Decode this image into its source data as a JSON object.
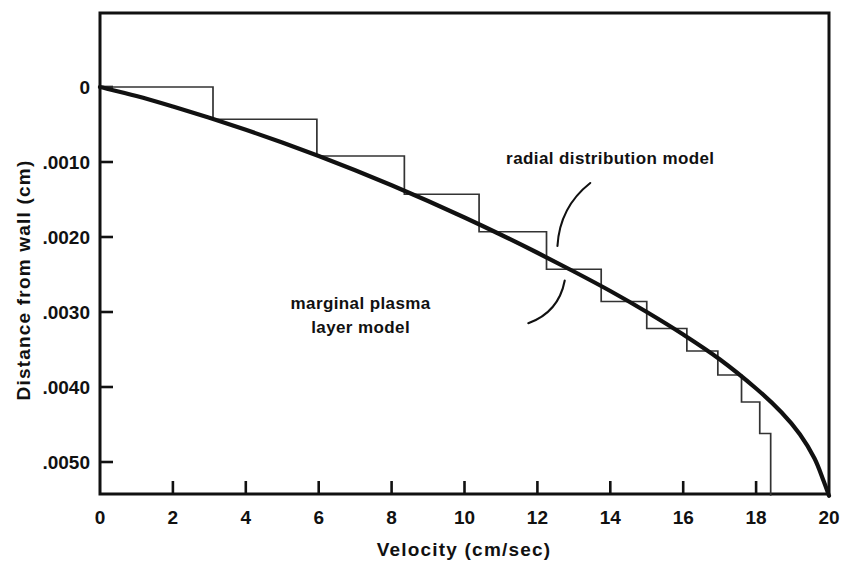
{
  "chart_data": {
    "type": "line",
    "title": "",
    "xlabel": "Velocity (cm/sec)",
    "ylabel": "Distance from wall  (cm)",
    "xlim": [
      0,
      20
    ],
    "ylim": [
      0,
      0.0055
    ],
    "y_axis_inverted": true,
    "grid": false,
    "legend_position": "inline-annotations",
    "xticks": [
      0,
      2,
      4,
      6,
      8,
      10,
      12,
      14,
      16,
      18,
      20
    ],
    "xtick_labels": [
      "0",
      "2",
      "4",
      "6",
      "8",
      "10",
      "12",
      "14",
      "16",
      "18",
      "20"
    ],
    "yticks": [
      0,
      0.001,
      0.002,
      0.003,
      0.004,
      0.005
    ],
    "ytick_labels": [
      "0",
      ".0010",
      ".0020",
      ".0030",
      ".0040",
      ".0050"
    ],
    "series": [
      {
        "name": "marginal plasma layer model",
        "style": "thick-smooth-curve",
        "color": "#111111",
        "points": [
          [
            0.0,
            0.0
          ],
          [
            1.0,
            0.00012
          ],
          [
            2.0,
            0.00026
          ],
          [
            3.0,
            0.00041
          ],
          [
            4.0,
            0.00057
          ],
          [
            5.0,
            0.00074
          ],
          [
            6.0,
            0.00092
          ],
          [
            7.0,
            0.00111
          ],
          [
            8.0,
            0.00131
          ],
          [
            9.0,
            0.00152
          ],
          [
            10.0,
            0.00174
          ],
          [
            11.0,
            0.00197
          ],
          [
            12.0,
            0.00221
          ],
          [
            13.0,
            0.00246
          ],
          [
            14.0,
            0.00272
          ],
          [
            15.0,
            0.003
          ],
          [
            16.0,
            0.0033
          ],
          [
            17.0,
            0.00363
          ],
          [
            18.0,
            0.00402
          ],
          [
            18.7,
            0.00434
          ],
          [
            19.2,
            0.00463
          ],
          [
            19.6,
            0.00495
          ],
          [
            19.85,
            0.00525
          ],
          [
            20.0,
            0.00545
          ]
        ]
      },
      {
        "name": "radial distribution model",
        "style": "staircase",
        "color": "#333333",
        "step_edges_velocity": [
          0.0,
          3.1,
          5.95,
          8.35,
          10.4,
          12.25,
          13.75,
          15.0,
          16.1,
          16.95,
          17.6,
          18.1,
          18.4
        ],
        "step_levels_distance": [
          0.0,
          0.00043,
          0.00092,
          0.00143,
          0.00193,
          0.00243,
          0.00286,
          0.00322,
          0.00352,
          0.00384,
          0.0042,
          0.00462,
          0.00545
        ]
      }
    ],
    "annotations": [
      {
        "name": "radial-distribution-model",
        "lines": [
          "radial distribution model"
        ],
        "text_x": 14.0,
        "text_y": 0.00102,
        "leader_from": [
          13.45,
          0.00128
        ],
        "leader_to": [
          12.55,
          0.00212
        ]
      },
      {
        "name": "marginal-plasma-layer-model",
        "lines": [
          "marginal plasma",
          "layer model"
        ],
        "text_x": 7.15,
        "text_y": 0.00296,
        "leader_from": [
          11.75,
          0.00315
        ],
        "leader_to": [
          12.75,
          0.00258
        ]
      }
    ]
  },
  "axis": {
    "x_title": "Velocity (cm/sec)",
    "y_title": "Distance from wall  (cm)"
  },
  "caption": {
    "partial_text": ""
  }
}
